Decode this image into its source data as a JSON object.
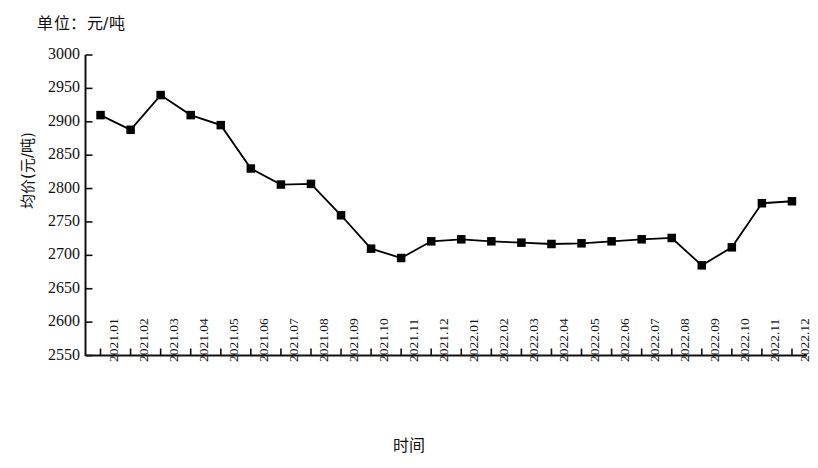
{
  "chart_data": {
    "type": "line",
    "title": "",
    "unit_note": "单位：元/吨",
    "xlabel": "时间",
    "ylabel": "均价(元/吨)",
    "grid": false,
    "legend": "none",
    "marker": "filled-square",
    "line_color": "#000000",
    "marker_color": "#000000",
    "ylim": [
      2550,
      3000
    ],
    "ytick_step": 50,
    "yticks": [
      2550,
      2600,
      2650,
      2700,
      2750,
      2800,
      2850,
      2900,
      2950,
      3000
    ],
    "ytick_labels": [
      "2550",
      "2600",
      "2650",
      "2700",
      "2750",
      "2800",
      "2850",
      "2900",
      "2950",
      "3000"
    ],
    "categories": [
      "2021.01",
      "2021.02",
      "2021.03",
      "2021.04",
      "2021.05",
      "2021.06",
      "2021.07",
      "2021.08",
      "2021.09",
      "2021.10",
      "2021.11",
      "2021.12",
      "2022.01",
      "2022.02",
      "2022.03",
      "2022.04",
      "2022.05",
      "2022.06",
      "2022.07",
      "2022.08",
      "2022.09",
      "2022.10",
      "2022.11",
      "2022.12"
    ],
    "values": [
      2910,
      2888,
      2940,
      2910,
      2895,
      2830,
      2806,
      2807,
      2760,
      2710,
      2696,
      2721,
      2724,
      2721,
      2719,
      2717,
      2718,
      2721,
      2724,
      2726,
      2685,
      2712,
      2778,
      2781
    ],
    "series": [
      {
        "name": "均价",
        "values": [
          2910,
          2888,
          2940,
          2910,
          2895,
          2830,
          2806,
          2807,
          2760,
          2710,
          2696,
          2721,
          2724,
          2721,
          2719,
          2717,
          2718,
          2721,
          2724,
          2726,
          2685,
          2712,
          2778,
          2781
        ]
      }
    ]
  },
  "axes": {
    "unit_note": "单位：元/吨",
    "y_title": "均价(元/吨)",
    "x_title": "时间"
  }
}
